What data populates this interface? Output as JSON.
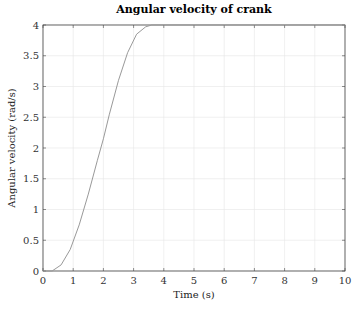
{
  "chart_data": {
    "type": "line",
    "title": "Angular velocity of crank",
    "xlabel": "Time (s)",
    "ylabel": "Angular velocity (rad/s)",
    "xlim": [
      0,
      10
    ],
    "ylim": [
      0,
      4
    ],
    "xticks": [
      0,
      1,
      2,
      3,
      4,
      5,
      6,
      7,
      8,
      9,
      10
    ],
    "yticks": [
      0,
      0.5,
      1,
      1.5,
      2,
      2.5,
      3,
      3.5,
      4
    ],
    "grid": true,
    "legend": null,
    "series": [
      {
        "name": "Angular velocity",
        "color": "#999999",
        "x": [
          0,
          0.3,
          0.6,
          0.9,
          1.2,
          1.5,
          1.8,
          2.0,
          2.2,
          2.5,
          2.8,
          3.1,
          3.4,
          3.6,
          3.75,
          4,
          5,
          6,
          7,
          8,
          9,
          10
        ],
        "y": [
          0,
          0.0,
          0.1,
          0.35,
          0.75,
          1.25,
          1.8,
          2.15,
          2.55,
          3.1,
          3.55,
          3.85,
          3.97,
          4.0,
          4.0,
          4.0,
          4.0,
          4.0,
          4.0,
          4.0,
          4.0,
          4.0
        ]
      }
    ]
  }
}
